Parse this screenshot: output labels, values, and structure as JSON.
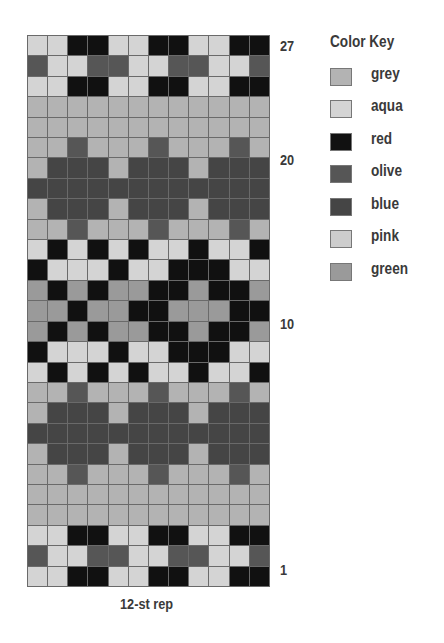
{
  "chart_data": {
    "type": "heatmap",
    "xlabel": "12-st rep",
    "ylabel": "",
    "columns": 12,
    "rows": 27,
    "row_order": "top row is 27, bottom row is 1",
    "row_tick_labels": [
      {
        "row": 27,
        "label": "27"
      },
      {
        "row": 20,
        "label": "20"
      },
      {
        "row": 10,
        "label": "10"
      },
      {
        "row": 1,
        "label": "1"
      }
    ],
    "legend": [
      {
        "code": "G",
        "name": "grey"
      },
      {
        "code": "A",
        "name": "aqua"
      },
      {
        "code": "R",
        "name": "red"
      },
      {
        "code": "O",
        "name": "olive"
      },
      {
        "code": "B",
        "name": "blue"
      },
      {
        "code": "P",
        "name": "pink"
      },
      {
        "code": "N",
        "name": "green"
      }
    ],
    "grid_top_to_bottom": [
      "AARRAARRAARR",
      "OAAOOAAOOAAO",
      "AARRAARRAARR",
      "GGGGGGGGGGGG",
      "GGGGGGGGGGGG",
      "GGOGGGOGGGOG",
      "GBBBGBBBGBBB",
      "BBBBBBBBBBBB",
      "GBBBGBBBGBBB",
      "GGOGGGOGGGOG",
      "ARARARAARAAR",
      "RAAARAARRRAA",
      "NRNRNNRRNRRN",
      "NNRNNRRNNNRR",
      "NRNRNNRRNRRN",
      "RAAARAARRRAA",
      "ARARARAARAAR",
      "GGOGGGOGGGOG",
      "GBBBGBBBGBBB",
      "BBBBBBBBBBBB",
      "GBBBGBBBGBBB",
      "GGOGGGOGGGOG",
      "GGGGGGGGGGGG",
      "GGGGGGGGGGGG",
      "AARRAARRAARR",
      "OAAOOAAOOAAO",
      "AARRAARRAARR"
    ]
  },
  "colors": {
    "G": "#b3b3b3",
    "A": "#d4d4d4",
    "R": "#111111",
    "O": "#565656",
    "B": "#454545",
    "P": "#cdcdcd",
    "N": "#9a9a9a"
  },
  "labels": {
    "row_27": "27",
    "row_20": "20",
    "row_10": "10",
    "row_1": "1",
    "rep": "12-st rep"
  },
  "key": {
    "title": "Color Key",
    "items": [
      {
        "name": "grey",
        "code": "G"
      },
      {
        "name": "aqua",
        "code": "A"
      },
      {
        "name": "red",
        "code": "R"
      },
      {
        "name": "olive",
        "code": "O"
      },
      {
        "name": "blue",
        "code": "B"
      },
      {
        "name": "pink",
        "code": "P"
      },
      {
        "name": "green",
        "code": "N"
      }
    ]
  }
}
